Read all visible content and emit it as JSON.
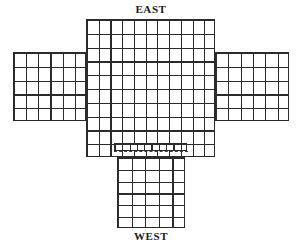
{
  "figure": {
    "type": "cruciform-grid-plan",
    "background_color": "#ffffff",
    "line_color": "#2b2b2b",
    "dashed_line_color": "#3a3a3a"
  },
  "labels": {
    "top": "EAST",
    "bottom": "WEST"
  },
  "blocks": {
    "center": {
      "name": "center-block",
      "x": 86,
      "y": 19,
      "width": 129,
      "height": 138,
      "columns": 11,
      "rows": 10,
      "cell_width": 11.7,
      "cell_height": 13.8
    },
    "left_wing": {
      "name": "left-wing-block",
      "x": 13,
      "y": 52,
      "width": 73,
      "height": 69,
      "columns": 6,
      "rows": 5,
      "cell_width": 12.2,
      "cell_height": 13.8
    },
    "right_wing": {
      "name": "right-wing-block",
      "x": 215,
      "y": 52,
      "width": 74,
      "height": 69,
      "columns": 6,
      "rows": 5,
      "cell_width": 12.3,
      "cell_height": 13.8
    },
    "fine_strip": {
      "name": "fine-strip-row",
      "x": 114,
      "y": 143,
      "width": 73,
      "height": 8,
      "columns": 10,
      "rows": 1,
      "cell_width": 7.3,
      "cell_height": 8
    },
    "bottom_stem": {
      "name": "bottom-stem-block",
      "x": 117,
      "y": 157,
      "width": 68,
      "height": 71,
      "columns": 5,
      "rows": 6,
      "cell_width": 13.6,
      "cell_height": 11.8
    }
  },
  "seam": {
    "name": "dashed-seam-line",
    "x": 114,
    "y": 151,
    "width": 74,
    "style": "dashed"
  }
}
